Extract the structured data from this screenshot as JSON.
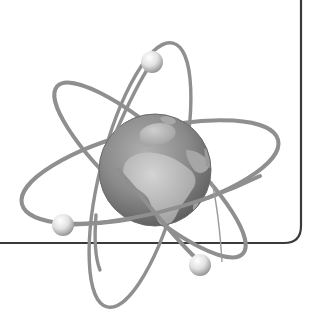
{
  "illustration": {
    "subject": "atom-with-globe-nucleus",
    "nucleus": "earth-globe",
    "electron_count": 3,
    "orbit_count": 3
  },
  "colors": {
    "background": "#ffffff",
    "frame": "#3a3a3a",
    "orbit": "#8a8a8a",
    "globe_ocean": "#6e6e6e",
    "globe_land": "#b5b5b5",
    "electron_highlight": "#ffffff",
    "electron_shadow": "#8c8c8c"
  }
}
